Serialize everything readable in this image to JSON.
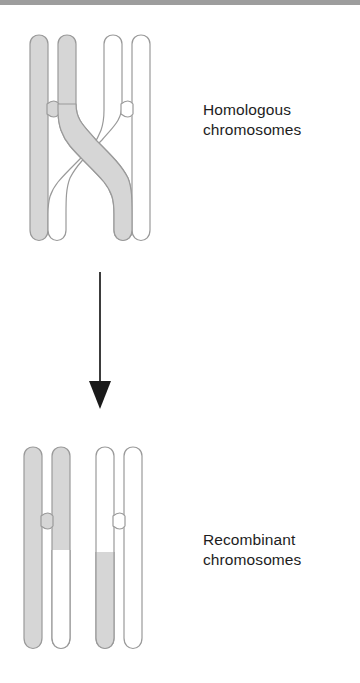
{
  "figure": {
    "background_color": "#ffffff",
    "width": 360,
    "height": 683
  },
  "colors": {
    "chromatid_shaded_fill": "#d6d6d6",
    "chromatid_unshaded_fill": "#ffffff",
    "chromatid_outline": "#9a9a9a",
    "arrow_color": "#1a1a1a",
    "text_color": "#1d1d1d",
    "scan_band": "#9d9d9d"
  },
  "labels": {
    "homologous": "Homologous\nchromosomes",
    "recombinant": "Recombinant\nchromosomes"
  },
  "stages": [
    {
      "name": "homologous-chromosomes",
      "label": "Homologous\nchromosomes",
      "description": "Two paired homologous chromosomes, one shaded and one unshaded, with a chiasma where a shaded chromatid crosses over an unshaded chromatid",
      "chromosomes": [
        {
          "name": "shaded-chromosome",
          "shading": "shaded",
          "chromatids": [
            {
              "name": "shaded-left-chromatid",
              "fill": "shaded",
              "crosses_over": false
            },
            {
              "name": "shaded-right-chromatid",
              "fill": "shaded",
              "crosses_over": true
            }
          ]
        },
        {
          "name": "unshaded-chromosome",
          "shading": "unshaded",
          "chromatids": [
            {
              "name": "unshaded-left-chromatid",
              "fill": "unshaded",
              "crosses_over": true
            },
            {
              "name": "unshaded-right-chromatid",
              "fill": "unshaded",
              "crosses_over": false
            }
          ]
        }
      ]
    },
    {
      "name": "recombinant-chromosomes",
      "label": "Recombinant\nchromosomes",
      "description": "The resulting recombinant chromosomes: each inner chromatid now carries an exchanged segment below the crossover point",
      "chromosomes": [
        {
          "name": "recombinant-chromosome-left",
          "chromatids": [
            {
              "name": "left-outer-chromatid",
              "fill": "shaded",
              "recombinant": false
            },
            {
              "name": "left-inner-chromatid",
              "fill": "shaded-above-unshaded-below",
              "recombinant": true
            }
          ]
        },
        {
          "name": "recombinant-chromosome-right",
          "chromatids": [
            {
              "name": "right-inner-chromatid",
              "fill": "unshaded-above-shaded-below",
              "recombinant": true
            },
            {
              "name": "right-outer-chromatid",
              "fill": "unshaded",
              "recombinant": false
            }
          ]
        }
      ]
    }
  ],
  "arrow": {
    "name": "process-arrow",
    "direction": "down",
    "from_stage": "homologous-chromosomes",
    "to_stage": "recombinant-chromosomes"
  }
}
